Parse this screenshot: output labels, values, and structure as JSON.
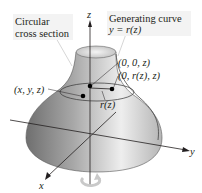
{
  "labels": {
    "circular_line1": "Circular",
    "circular_line2": "cross section",
    "generating_line1": "Generating curve",
    "generating_line2": "y = r(z)",
    "point_axis": "(0, 0, z)",
    "point_curve": "(0, r(z), z)",
    "point_general": "(x, y, z)",
    "radius": "r(z)"
  },
  "axes": {
    "x": "x",
    "y": "y",
    "z": "z"
  },
  "colors": {
    "surface_dark": "#7a7a7a",
    "surface_light": "#e8e8e8",
    "line": "#231f20",
    "callout_bg": "#f3f3f3",
    "rotation_arrow": "#c9c9c9"
  }
}
